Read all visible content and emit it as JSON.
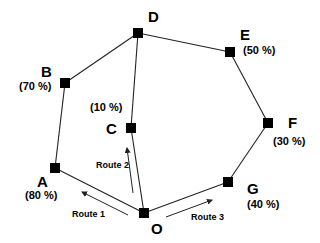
{
  "diagram": {
    "nodes": [
      {
        "id": "A",
        "label": "A",
        "percent": "(80 %)",
        "x": 55,
        "y": 168
      },
      {
        "id": "B",
        "label": "B",
        "percent": "(70 %)",
        "x": 65,
        "y": 83
      },
      {
        "id": "C",
        "label": "C",
        "percent": "(10 %)",
        "x": 131,
        "y": 128
      },
      {
        "id": "D",
        "label": "D",
        "percent": "",
        "x": 138,
        "y": 33
      },
      {
        "id": "E",
        "label": "E",
        "percent": "(50 %)",
        "x": 230,
        "y": 52
      },
      {
        "id": "F",
        "label": "F",
        "percent": "(30 %)",
        "x": 268,
        "y": 123
      },
      {
        "id": "G",
        "label": "G",
        "percent": "(40 %)",
        "x": 228,
        "y": 182
      },
      {
        "id": "O",
        "label": "O",
        "percent": "",
        "x": 144,
        "y": 213
      }
    ],
    "edges": [
      [
        "O",
        "A"
      ],
      [
        "A",
        "B"
      ],
      [
        "B",
        "D"
      ],
      [
        "D",
        "C"
      ],
      [
        "C",
        "O"
      ],
      [
        "D",
        "E"
      ],
      [
        "E",
        "F"
      ],
      [
        "F",
        "G"
      ],
      [
        "G",
        "O"
      ]
    ],
    "routes": [
      {
        "label": "Route 1",
        "direction": "O to A"
      },
      {
        "label": "Route 2",
        "direction": "O to C"
      },
      {
        "label": "Route 3",
        "direction": "O to G"
      }
    ],
    "colors": {
      "line": "#222222",
      "node": "#000000",
      "background": "#ffffff"
    }
  }
}
